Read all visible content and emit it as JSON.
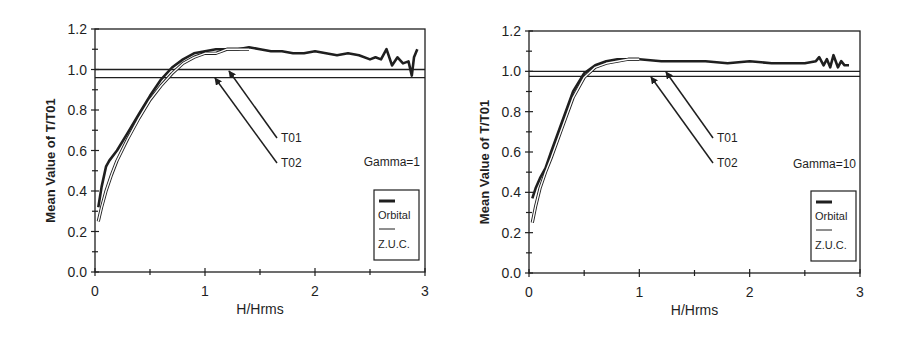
{
  "chart_data": [
    {
      "type": "line",
      "panel": "left",
      "title": "",
      "xlabel": "H/Hrms",
      "ylabel": "Mean Value of T/T01",
      "xlim": [
        0,
        3
      ],
      "ylim": [
        0,
        1.2
      ],
      "xticks": [
        "0",
        "1",
        "2",
        "3"
      ],
      "yticks": [
        "0.0",
        "0.2",
        "0.4",
        "0.6",
        "0.8",
        "1.0",
        "1.2"
      ],
      "grid": false,
      "annotation": "Gamma=1",
      "reference_lines": [
        {
          "label": "T01",
          "y": 1.0
        },
        {
          "label": "T02",
          "y": 0.96
        }
      ],
      "legend": {
        "position": "lower right",
        "entries": [
          "Orbital",
          "Z.U.C."
        ]
      },
      "series": [
        {
          "name": "Orbital",
          "style": "thick",
          "x": [
            0.03,
            0.06,
            0.1,
            0.13,
            0.2,
            0.3,
            0.4,
            0.5,
            0.6,
            0.7,
            0.8,
            0.9,
            1.0,
            1.1,
            1.2,
            1.3,
            1.4,
            1.5,
            1.6,
            1.7,
            1.8,
            1.9,
            2.0,
            2.1,
            2.2,
            2.3,
            2.4,
            2.5,
            2.55,
            2.6,
            2.65,
            2.7,
            2.75,
            2.8,
            2.85,
            2.88,
            2.9,
            2.93
          ],
          "values": [
            0.32,
            0.42,
            0.52,
            0.55,
            0.6,
            0.69,
            0.78,
            0.87,
            0.95,
            1.01,
            1.05,
            1.08,
            1.09,
            1.1,
            1.1,
            1.1,
            1.11,
            1.1,
            1.09,
            1.09,
            1.08,
            1.08,
            1.09,
            1.08,
            1.07,
            1.08,
            1.07,
            1.05,
            1.06,
            1.05,
            1.1,
            1.02,
            1.06,
            1.03,
            1.04,
            0.97,
            1.06,
            1.1
          ]
        },
        {
          "name": "Z.U.C.",
          "style": "thin",
          "x": [
            0.03,
            0.06,
            0.1,
            0.15,
            0.2,
            0.3,
            0.4,
            0.5,
            0.6,
            0.7,
            0.8,
            0.9,
            1.0,
            1.1,
            1.15,
            1.2,
            1.3,
            1.4
          ],
          "values": [
            0.25,
            0.32,
            0.4,
            0.48,
            0.55,
            0.66,
            0.76,
            0.85,
            0.92,
            0.98,
            1.03,
            1.06,
            1.08,
            1.08,
            1.09,
            1.1,
            1.1,
            1.1
          ]
        }
      ]
    },
    {
      "type": "line",
      "panel": "right",
      "title": "",
      "xlabel": "H/Hrms",
      "ylabel": "Mean Value of T/T01",
      "xlim": [
        0,
        3
      ],
      "ylim": [
        0,
        1.2
      ],
      "xticks": [
        "0",
        "1",
        "2",
        "3"
      ],
      "yticks": [
        "0.0",
        "0.2",
        "0.4",
        "0.6",
        "0.8",
        "1.0",
        "1.2"
      ],
      "grid": false,
      "annotation": "Gamma=10",
      "reference_lines": [
        {
          "label": "T01",
          "y": 1.0
        },
        {
          "label": "T02",
          "y": 0.975
        }
      ],
      "legend": {
        "position": "lower right",
        "entries": [
          "Orbital",
          "Z.U.C."
        ]
      },
      "series": [
        {
          "name": "Orbital",
          "style": "thick",
          "x": [
            0.03,
            0.06,
            0.1,
            0.15,
            0.2,
            0.3,
            0.4,
            0.5,
            0.6,
            0.7,
            0.8,
            0.9,
            1.0,
            1.2,
            1.4,
            1.6,
            1.8,
            2.0,
            2.2,
            2.4,
            2.5,
            2.6,
            2.63,
            2.67,
            2.7,
            2.73,
            2.76,
            2.8,
            2.83,
            2.86,
            2.9
          ],
          "values": [
            0.37,
            0.42,
            0.47,
            0.52,
            0.6,
            0.75,
            0.9,
            0.99,
            1.03,
            1.05,
            1.06,
            1.06,
            1.06,
            1.05,
            1.05,
            1.05,
            1.04,
            1.05,
            1.04,
            1.04,
            1.04,
            1.05,
            1.07,
            1.03,
            1.06,
            1.02,
            1.08,
            1.02,
            1.05,
            1.03,
            1.03
          ]
        },
        {
          "name": "Z.U.C.",
          "style": "thin",
          "x": [
            0.03,
            0.06,
            0.1,
            0.15,
            0.2,
            0.3,
            0.4,
            0.5,
            0.6,
            0.7,
            0.8,
            0.9,
            1.0
          ],
          "values": [
            0.25,
            0.33,
            0.42,
            0.5,
            0.57,
            0.72,
            0.87,
            0.97,
            1.02,
            1.04,
            1.05,
            1.06,
            1.06
          ]
        }
      ]
    }
  ],
  "panels": [
    {
      "ylabel": "Mean Value of T/T01",
      "xlabel": "H/Hrms",
      "annotation": "Gamma=1",
      "arrow_labels": [
        "T01",
        "T02"
      ],
      "legend": [
        "Orbital",
        "Z.U.C."
      ],
      "yticks": [
        "0.0",
        "0.2",
        "0.4",
        "0.6",
        "0.8",
        "1.0",
        "1.2"
      ],
      "xticks": [
        "0",
        "1",
        "2",
        "3"
      ]
    },
    {
      "ylabel": "Mean Value of T/T01",
      "xlabel": "H/Hrms",
      "annotation": "Gamma=10",
      "arrow_labels": [
        "T01",
        "T02"
      ],
      "legend": [
        "Orbital",
        "Z.U.C."
      ],
      "yticks": [
        "0.0",
        "0.2",
        "0.4",
        "0.6",
        "0.8",
        "1.0",
        "1.2"
      ],
      "xticks": [
        "0",
        "1",
        "2",
        "3"
      ]
    }
  ],
  "colors": {
    "ink": "#1f1f1f",
    "background": "#ffffff"
  }
}
